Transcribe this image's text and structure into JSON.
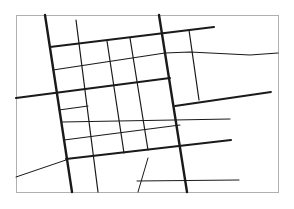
{
  "map": {
    "width": 294,
    "height": 209,
    "background": "#ffffff",
    "frame": {
      "x": 16,
      "y": 15,
      "w": 262,
      "h": 177,
      "stroke": "#b0b0b0"
    },
    "road_color": "#1a1a1a",
    "major_roads": [
      {
        "id": "major-avenue-west",
        "points": [
          [
            45,
            15
          ],
          [
            72,
            192
          ]
        ],
        "width": 2.4
      },
      {
        "id": "major-avenue-east",
        "points": [
          [
            159,
            15
          ],
          [
            187,
            192
          ]
        ],
        "width": 2.4
      },
      {
        "id": "major-street-north",
        "points": [
          [
            50,
            47
          ],
          [
            214,
            27
          ]
        ],
        "width": 2.0
      },
      {
        "id": "major-street-middle",
        "points": [
          [
            16,
            98
          ],
          [
            170,
            78
          ]
        ],
        "width": 2.0
      },
      {
        "id": "major-street-south",
        "points": [
          [
            66,
            159
          ],
          [
            231,
            140
          ]
        ],
        "width": 2.0
      },
      {
        "id": "major-street-east-ext",
        "points": [
          [
            175,
            106
          ],
          [
            271,
            92
          ]
        ],
        "width": 1.8
      }
    ],
    "minor_roads": [
      {
        "id": "minor-avenue-1",
        "points": [
          [
            76,
            20
          ],
          [
            98,
            192
          ]
        ],
        "width": 1.2
      },
      {
        "id": "minor-avenue-2",
        "points": [
          [
            107,
            41
          ],
          [
            124,
            153
          ]
        ],
        "width": 1.2
      },
      {
        "id": "minor-avenue-3",
        "points": [
          [
            130,
            38
          ],
          [
            148,
            150
          ]
        ],
        "width": 1.2
      },
      {
        "id": "minor-avenue-4",
        "points": [
          [
            189,
            30
          ],
          [
            199,
            100
          ]
        ],
        "width": 1.2
      },
      {
        "id": "minor-street-1",
        "points": [
          [
            53,
            70
          ],
          [
            165,
            53
          ]
        ],
        "width": 1.1
      },
      {
        "id": "minor-street-1-east",
        "points": [
          [
            165,
            53
          ],
          [
            190,
            52
          ],
          [
            250,
            55
          ],
          [
            278,
            53
          ]
        ],
        "width": 1.1
      },
      {
        "id": "minor-street-2",
        "points": [
          [
            59,
            110
          ],
          [
            88,
            106
          ]
        ],
        "width": 1.1
      },
      {
        "id": "minor-street-3",
        "points": [
          [
            62,
            122
          ],
          [
            230,
            119
          ]
        ],
        "width": 1.1
      },
      {
        "id": "minor-street-4",
        "points": [
          [
            64,
            140
          ],
          [
            180,
            125
          ]
        ],
        "width": 1.1
      },
      {
        "id": "minor-street-south-east",
        "points": [
          [
            137,
            181
          ],
          [
            239,
            180
          ]
        ],
        "width": 1.0
      },
      {
        "id": "minor-road-southwest",
        "points": [
          [
            16,
            177
          ],
          [
            66,
            160
          ]
        ],
        "width": 1.0
      },
      {
        "id": "minor-road-south-spur",
        "points": [
          [
            148,
            158
          ],
          [
            138,
            192
          ]
        ],
        "width": 1.0
      }
    ]
  }
}
